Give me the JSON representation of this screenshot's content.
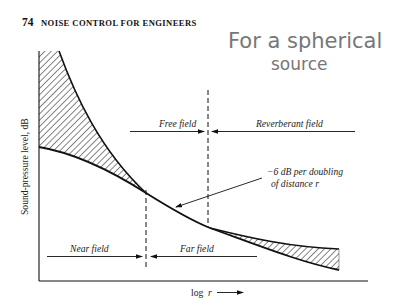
{
  "header": {
    "page_number": "74",
    "running_title": "NOISE CONTROL FOR ENGINEERS"
  },
  "handwritten_note": {
    "line1": "For a spherical",
    "line2": "source"
  },
  "figure": {
    "y_axis_label": "Sound-pressure level, dB",
    "x_axis_label": "log",
    "x_axis_var": "r",
    "regions_top": {
      "free_field": "Free field",
      "reverberant_field": "Reverberant field"
    },
    "regions_bottom": {
      "near_field": "Near field",
      "far_field": "Far field"
    },
    "annotation": {
      "line1": "−6 dB per doubling",
      "line2": "of distance r"
    },
    "colors": {
      "ink": "#111111",
      "handwriting": "#777777"
    }
  }
}
